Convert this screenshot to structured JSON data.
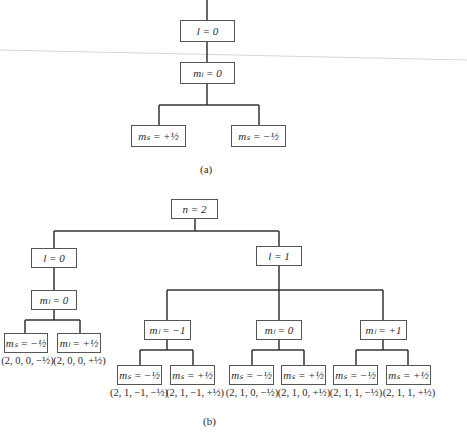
{
  "diagram_a": {
    "caption": "(a)",
    "nodes": {
      "l": "l = 0",
      "ml": "mₗ = 0",
      "ms_plus": "mₛ = +½",
      "ms_minus": "mₛ = −½"
    }
  },
  "diagram_b": {
    "caption": "(b)",
    "root": "n = 2",
    "l0": "l = 0",
    "l1": "l = 1",
    "l0_ml0": "mₗ = 0",
    "l1_ml_m1": "mₗ = −1",
    "l1_ml_0": "mₗ = 0",
    "l1_ml_p1": "mₗ = +1",
    "leaves": [
      {
        "box": "mₛ = −½",
        "tuple": "(2, 0, 0, −½)"
      },
      {
        "box": "mₗ = +½",
        "tuple": "(2, 0, 0, +½)"
      },
      {
        "box": "mₛ = −½",
        "tuple": "(2, 1, −1, −½)"
      },
      {
        "box": "mₛ = +½",
        "tuple": "(2, 1, −1, +½)"
      },
      {
        "box": "mₛ = −½",
        "tuple": "(2, 1, 0, −½)"
      },
      {
        "box": "mₛ = +½",
        "tuple": "(2, 1, 0, +½)"
      },
      {
        "box": "mₛ = −½",
        "tuple": "(2, 1, 1, −½)"
      },
      {
        "box": "mₛ = +½",
        "tuple": "(2, 1, 1, +½)"
      }
    ]
  }
}
